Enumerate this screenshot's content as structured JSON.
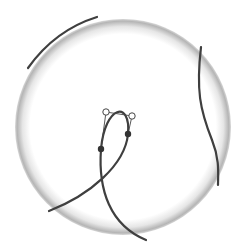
{
  "diagram": {
    "type": "sphere-with-bezier-curves",
    "sphere": {
      "center": [
        123,
        127
      ],
      "radius": 108,
      "edge_color": "#b8b8b8",
      "fill_color": "#ffffff"
    },
    "curves": [
      {
        "name": "top-left-arc",
        "d": "M 28 68 Q 55 30 97 17",
        "color": "#3f3f3f"
      },
      {
        "name": "right-curve",
        "d": "M 201 47 C 196 90, 200 110, 212 140 C 220 160, 218 175, 218 185",
        "color": "#3f3f3f"
      },
      {
        "name": "loop-curve",
        "d": "M 49 211 C 90 195, 125 165, 128 134 C 131 100, 105 105, 101 149 C 98 190, 110 225, 146 240",
        "color": "#3f3f3f"
      }
    ],
    "control_handles": [
      {
        "from": [
          101,
          149
        ],
        "to": [
          106,
          112
        ]
      },
      {
        "from": [
          106,
          112
        ],
        "to": [
          132,
          116
        ]
      },
      {
        "from": [
          132,
          116
        ],
        "to": [
          128,
          134
        ]
      }
    ],
    "control_points_open": [
      [
        106,
        112
      ],
      [
        132,
        116
      ]
    ],
    "anchor_points_filled": [
      [
        101,
        149
      ],
      [
        128,
        134
      ]
    ]
  }
}
